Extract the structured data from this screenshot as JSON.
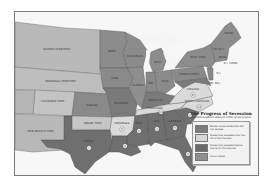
{
  "map": {
    "title": "The Progress of Secession",
    "subtitle": "(Circled numbers indicate order of secession)",
    "colors": {
      "union": "#8c8c8c",
      "territory": "#b9b9b9",
      "border": "#7a7a7a",
      "seceded_after": "#dadada",
      "seceded_before": "#6f6f6f",
      "water": "#f7f7f7",
      "frame": "#7a7a7a"
    },
    "legend": [
      {
        "label": "Border slave states that did not secede",
        "color": "#7c7c7c"
      },
      {
        "label": "States that seceded after the fall of Fort Sumter",
        "color": "#d6d6d6"
      },
      {
        "label": "States that seceded before the fall of Fort Sumter",
        "color": "#6a6a6a"
      },
      {
        "label": "Union states",
        "color": "#8f8f8f"
      }
    ],
    "regions": {
      "dakota": "DAKOTA TERRITORY",
      "nebraska": "NEBRASKA TERRITORY",
      "colorado": "COLORADO TERR.",
      "new_mexico": "NEW MEXICO TERR.",
      "indian": "INDIAN TERR.",
      "kansas": "KANSAS",
      "minnesota": "MINN.",
      "wisconsin": "WISCONSIN",
      "iowa": "IOWA",
      "illinois": "ILLINOIS",
      "missouri": "MISSOURI",
      "michigan": "MICH.",
      "indiana": "IND.",
      "ohio": "OHIO",
      "kentucky": "KENTUCKY",
      "pennsylvania": "PENNSYLVANIA",
      "new_york": "NEW YORK",
      "maine": "MAINE",
      "vt_nh": "VT. N.H.",
      "mass": "MASS.",
      "ri_conn": "R.I. CONN.",
      "nj": "N.J.",
      "md_del": "MD. DEL.",
      "virginia": "VIRGINIA",
      "north_carolina": "NORTH CAROLINA",
      "tennessee": "TENNESSEE",
      "arkansas": "ARKANSAS",
      "texas": "TEXAS",
      "louisiana": "LA.",
      "mississippi": "MISS.",
      "alabama": "ALA.",
      "georgia": "GEORGIA",
      "south_carolina": "S.C.",
      "florida": "FLA."
    },
    "order": {
      "south_carolina": "1",
      "mississippi": "2",
      "florida": "3",
      "alabama": "4",
      "georgia": "5",
      "louisiana": "6",
      "texas": "7",
      "virginia": "8",
      "arkansas": "9",
      "north_carolina": "10",
      "tennessee": "11"
    }
  }
}
